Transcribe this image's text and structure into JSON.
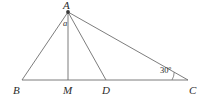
{
  "figure": {
    "kind": "geometry-diagram",
    "width": 204,
    "height": 104,
    "background_color": "#ffffff",
    "line_color": "#6e6e6e",
    "text_color": "#2b2b2b"
  },
  "points": {
    "A": {
      "label": "A",
      "x": 68,
      "y": 12,
      "marked": true
    },
    "B": {
      "label": "B",
      "x": 22,
      "y": 80,
      "marked": false
    },
    "M": {
      "label": "M",
      "x": 68,
      "y": 80,
      "marked": false
    },
    "D": {
      "label": "D",
      "x": 106,
      "y": 80,
      "marked": false
    },
    "C": {
      "label": "C",
      "x": 188,
      "y": 80,
      "marked": false
    }
  },
  "segments": [
    {
      "name": "base-BC",
      "from": "B",
      "to": "C"
    },
    {
      "name": "side-AB",
      "from": "A",
      "to": "B"
    },
    {
      "name": "altitude-AM",
      "from": "A",
      "to": "M"
    },
    {
      "name": "cevian-AD",
      "from": "A",
      "to": "D"
    },
    {
      "name": "side-AC",
      "from": "A",
      "to": "C"
    }
  ],
  "angles": {
    "alpha_at_A": {
      "label": "a",
      "vertex": "A",
      "between": [
        "AB",
        "AM"
      ]
    },
    "angle_at_C": {
      "label": "30º",
      "vertex": "C",
      "between": [
        "CA",
        "CB"
      ],
      "arc": true
    }
  }
}
